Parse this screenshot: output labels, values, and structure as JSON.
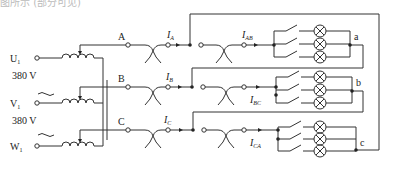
{
  "caption_cut": "图所示 (部分可见)",
  "source": {
    "phases": [
      {
        "name": "U",
        "sub": "1"
      },
      {
        "name": "V",
        "sub": "1"
      },
      {
        "name": "W",
        "sub": "1"
      }
    ],
    "voltage_labels": [
      "380 V",
      "380 V"
    ],
    "ac_symbol": "~"
  },
  "lines": [
    {
      "name": "A",
      "current": "I",
      "current_sub": "A",
      "load_current_sub": "AB"
    },
    {
      "name": "B",
      "current": "I",
      "current_sub": "B",
      "load_current_sub": "BC"
    },
    {
      "name": "C",
      "current": "I",
      "current_sub": "C",
      "load_current_sub": "CA"
    }
  ],
  "loads": [
    {
      "node": "a",
      "lamps": 3,
      "switches": 3
    },
    {
      "node": "b",
      "lamps": 3,
      "switches": 3
    },
    {
      "node": "c",
      "lamps": 3,
      "switches": 3
    }
  ]
}
